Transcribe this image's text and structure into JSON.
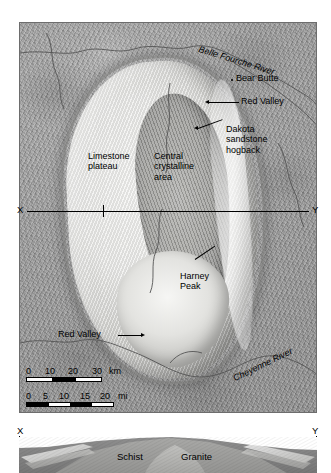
{
  "figure": {
    "type": "shaded-relief map with geologic cross-section",
    "region": "Black Hills uplift, South Dakota"
  },
  "map": {
    "name": "black-hills-shaded-relief-map",
    "annotations": [
      {
        "id": "belle-fourche-river",
        "text": "Belle Fourche River",
        "style": "italic",
        "kind": "river-label"
      },
      {
        "id": "bear-butte",
        "text": "Bear Butte",
        "style": "normal",
        "kind": "point-feature",
        "marker": "dot"
      },
      {
        "id": "red-valley-north",
        "text": "Red Valley",
        "style": "normal",
        "kind": "leader-label"
      },
      {
        "id": "dakota-sandstone-hogback",
        "text": "Dakota\nsandstone\nhogback",
        "style": "normal",
        "kind": "leader-label"
      },
      {
        "id": "limestone-plateau",
        "text": "Limestone\nplateau",
        "style": "normal",
        "kind": "area-label"
      },
      {
        "id": "central-crystalline-area",
        "text": "Central\ncrystalline\narea",
        "style": "normal",
        "kind": "area-label"
      },
      {
        "id": "harney-peak",
        "text": "Harney\nPeak",
        "style": "normal",
        "kind": "leader-label"
      },
      {
        "id": "red-valley-south",
        "text": "Red Valley",
        "style": "normal",
        "kind": "leader-label"
      },
      {
        "id": "cheyenne-river",
        "text": "Cheyenne River",
        "style": "italic",
        "kind": "river-label"
      }
    ],
    "section_line": {
      "left_label": "X",
      "right_label": "Y"
    }
  },
  "scale_bars": [
    {
      "id": "scale-km",
      "unit": "km",
      "ticks": [
        "0",
        "10",
        "20",
        "30"
      ],
      "segments": [
        "white",
        "black",
        "white"
      ]
    },
    {
      "id": "scale-mi",
      "unit": "mi",
      "ticks": [
        "0",
        "5",
        "10",
        "15",
        "20"
      ],
      "segments": [
        "black",
        "white",
        "black",
        "white"
      ]
    }
  ],
  "cross_section": {
    "name": "x-y-geologic-cross-section",
    "left_label": "X",
    "right_label": "Y",
    "units": [
      {
        "id": "schist",
        "text": "Schist"
      },
      {
        "id": "granite",
        "text": "Granite"
      }
    ]
  },
  "colors": {
    "terrain_mid": "#9b9b9b",
    "terrain_light": "#f2f2f0",
    "terrain_dark": "#7d7d7d",
    "ink": "#000000",
    "river": "#555555"
  }
}
